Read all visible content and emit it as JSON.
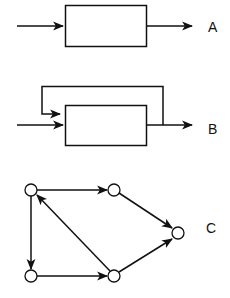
{
  "diagrams": [
    {
      "label": "A",
      "type": "open-loop block",
      "description": "Single block with input arrow and output arrow"
    },
    {
      "label": "B",
      "type": "feedback block",
      "description": "Single block with input, output, and feedback path from output back to input"
    },
    {
      "label": "C",
      "type": "directed graph",
      "nodes": [
        {
          "id": "n1",
          "position": "top-left"
        },
        {
          "id": "n2",
          "position": "top-middle"
        },
        {
          "id": "n3",
          "position": "right"
        },
        {
          "id": "n4",
          "position": "bottom-left"
        },
        {
          "id": "n5",
          "position": "bottom-middle"
        }
      ],
      "edges": [
        {
          "from": "n1",
          "to": "n2"
        },
        {
          "from": "n2",
          "to": "n3"
        },
        {
          "from": "n1",
          "to": "n4"
        },
        {
          "from": "n4",
          "to": "n5"
        },
        {
          "from": "n5",
          "to": "n3"
        },
        {
          "from": "n5",
          "to": "n1"
        }
      ]
    }
  ],
  "colors": {
    "stroke": "#111111",
    "background": "#ffffff"
  }
}
